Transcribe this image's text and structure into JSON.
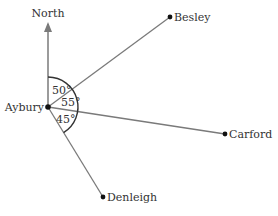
{
  "diagram": {
    "north_label": "North",
    "origin": {
      "name": "Aybury"
    },
    "places": [
      {
        "name": "Besley"
      },
      {
        "name": "Carford"
      },
      {
        "name": "Denleigh"
      }
    ],
    "angles": [
      {
        "label": "50°",
        "between": [
          "North",
          "Besley"
        ]
      },
      {
        "label": "55°",
        "between": [
          "Besley",
          "Carford"
        ]
      },
      {
        "label": "45°",
        "between": [
          "Carford",
          "Denleigh"
        ]
      }
    ],
    "colors": {
      "line": "#7a7a7a",
      "arc": "#333333",
      "text": "#333333",
      "point": "#111111"
    }
  }
}
